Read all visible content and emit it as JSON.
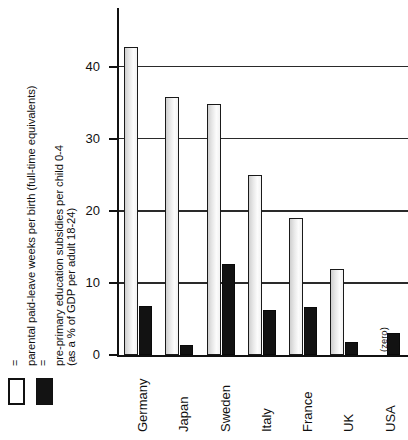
{
  "chart_data": {
    "type": "bar",
    "title": "",
    "xlabel": "",
    "ylabel": "",
    "ylim": [
      0,
      44
    ],
    "grid": true,
    "legend_position": "left",
    "categories": [
      "Germany",
      "Japan",
      "Sweden",
      "Italy",
      "France",
      "UK",
      "USA"
    ],
    "ytick_labels": [
      "0",
      "10",
      "20",
      "30",
      "40"
    ],
    "yticks": [
      0,
      10,
      20,
      30,
      40
    ],
    "series": [
      {
        "name": "= parental paid-leave weeks per birth (full-time equivalents)",
        "short_name": "parental paid-leave weeks per birth",
        "style": "open",
        "color": "#ffffff",
        "edge_color": "#1a1a1a",
        "values": [
          42.8,
          35.8,
          34.8,
          25.0,
          19.0,
          12.0,
          0
        ]
      },
      {
        "name": "= pre-primary education subsidies per child 0-4 (as a % of GDP per adult 18-24)",
        "short_name": "pre-primary education subsidies per child 0-4",
        "style": "filled",
        "color": "#121212",
        "edge_color": "#0a0a0a",
        "values": [
          6.8,
          1.4,
          12.6,
          6.3,
          6.7,
          1.8,
          3.0
        ]
      }
    ],
    "annotations": [
      {
        "text": "(zero)",
        "category": "USA",
        "series": "parental paid-leave weeks per birth"
      }
    ]
  },
  "legend": {
    "entries": [
      {
        "equals": "=",
        "swatch": "open",
        "line1": "parental paid-leave weeks per birth (full-time equivalents)",
        "line2": ""
      },
      {
        "equals": "=",
        "swatch": "filled",
        "line1": "pre-primary education subsidies per child 0-4",
        "line2": "(as a % of GDP per adult 18-24)"
      }
    ]
  }
}
